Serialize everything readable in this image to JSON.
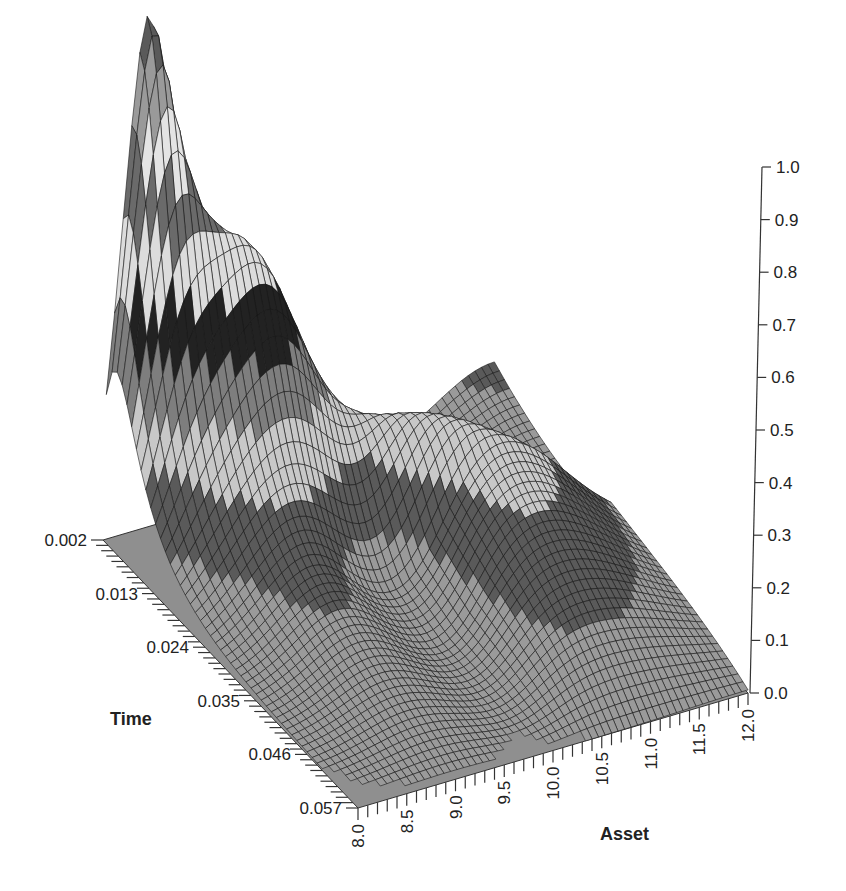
{
  "chart_data": {
    "type": "surface3d",
    "title": "",
    "xlabel": "Asset",
    "ylabel": "Time",
    "zlabel": "",
    "x_ticks": [
      "8.0",
      "8.5",
      "9.0",
      "9.5",
      "10.0",
      "10.5",
      "11.0",
      "11.5",
      "12.0"
    ],
    "y_ticks": [
      "0.002",
      "0.013",
      "0.024",
      "0.035",
      "0.046",
      "0.057"
    ],
    "z_ticks": [
      "0.0",
      "0.1",
      "0.2",
      "0.3",
      "0.4",
      "0.5",
      "0.6",
      "0.7",
      "0.8",
      "0.9",
      "1.0"
    ],
    "xlim": [
      8.0,
      12.0
    ],
    "ylim": [
      0.002,
      0.057
    ],
    "zlim": [
      0.0,
      1.0
    ],
    "grid": false,
    "legend": null,
    "shading_bands": [
      "#9a9a9a",
      "#5a5a5a",
      "#c8c8c8",
      "#7e7e7e",
      "#222222",
      "#dcdcdc",
      "#6a6a6a",
      "#e4e4e4"
    ],
    "floor_color": "#8f8f8f"
  }
}
